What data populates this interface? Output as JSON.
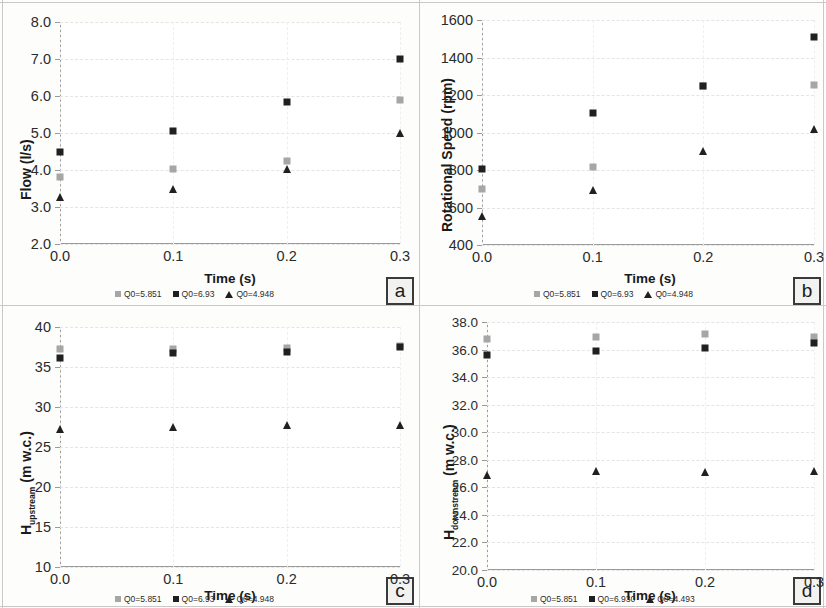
{
  "figure": {
    "background": "#fdfdfc",
    "series_colors": {
      "q0_gray": "#a6a6a6",
      "q0_black": "#202020",
      "q0_triangle": "#202020"
    }
  },
  "panels": [
    {
      "id": "a",
      "badge": "a",
      "xlabel": "Time (s)",
      "ylabel_main": "Flow (l/s)",
      "ylabel_sub": "",
      "xticks": [
        "0.0",
        "0.1",
        "0.2",
        "0.3"
      ],
      "yticks": [
        "8.0",
        "7.0",
        "6.0",
        "5.0",
        "4.0",
        "3.0",
        "2.0"
      ],
      "legend": [
        "Q0=5.851",
        "Q0=6.93",
        "Q0=4.948"
      ]
    },
    {
      "id": "b",
      "badge": "b",
      "xlabel": "Time (s)",
      "ylabel_main": "Rotational Speed (rpm)",
      "ylabel_sub": "",
      "xticks": [
        "0.0",
        "0.1",
        "0.2",
        "0.3"
      ],
      "yticks": [
        "1600",
        "1400",
        "1200",
        "1000",
        "800",
        "600",
        "400"
      ],
      "legend": [
        "Q0=5.851",
        "Q0=6.93",
        "Q0=4.948"
      ]
    },
    {
      "id": "c",
      "badge": "c",
      "xlabel": "Time (s)",
      "ylabel_main": "H",
      "ylabel_sub": "upstream",
      "ylabel_tail": "  (m w.c.)",
      "xticks": [
        "0.0",
        "0.1",
        "0.2",
        "0.3"
      ],
      "yticks": [
        "40",
        "35",
        "30",
        "25",
        "20",
        "15",
        "10"
      ],
      "legend": [
        "Q0=5.851",
        "Q0=6.93",
        "Q0=4.948"
      ]
    },
    {
      "id": "d",
      "badge": "d",
      "xlabel": "Time (s)",
      "ylabel_main": "H",
      "ylabel_sub": "downstream",
      "ylabel_tail": "  (m w.c.)",
      "xticks": [
        "0.0",
        "0.1",
        "0.2",
        "0.3"
      ],
      "yticks": [
        "38.0",
        "36.0",
        "34.0",
        "32.0",
        "30.0",
        "28.0",
        "26.0",
        "24.0",
        "22.0",
        "20.0"
      ],
      "legend": [
        "Q0=5.851",
        "Q0=6.930",
        "Q0=4.493"
      ]
    }
  ],
  "chart_data": [
    {
      "panel": "a",
      "type": "scatter",
      "title": "",
      "xlabel": "Time (s)",
      "ylabel": "Flow (l/s)",
      "x": [
        0.0,
        0.1,
        0.2,
        0.3
      ],
      "xlim": [
        0.0,
        0.3
      ],
      "ylim": [
        2.0,
        8.0
      ],
      "yticks": [
        2.0,
        3.0,
        4.0,
        5.0,
        6.0,
        7.0,
        8.0
      ],
      "grid": true,
      "legend_position": "below-axis",
      "series": [
        {
          "name": "Q0=5.851",
          "marker": "square",
          "color": "#a6a6a6",
          "values": [
            3.82,
            4.03,
            4.25,
            5.9
          ]
        },
        {
          "name": "Q0=6.93",
          "marker": "square",
          "color": "#202020",
          "values": [
            4.5,
            5.05,
            5.85,
            7.0
          ]
        },
        {
          "name": "Q0=4.948",
          "marker": "triangle",
          "color": "#202020",
          "values": [
            3.28,
            3.5,
            4.03,
            5.0
          ]
        }
      ]
    },
    {
      "panel": "b",
      "type": "scatter",
      "title": "",
      "xlabel": "Time (s)",
      "ylabel": "Rotational Speed (rpm)",
      "x": [
        0.0,
        0.1,
        0.2,
        0.3
      ],
      "xlim": [
        0.0,
        0.3
      ],
      "ylim": [
        400,
        1600
      ],
      "yticks": [
        400,
        600,
        800,
        1000,
        1200,
        1400,
        1600
      ],
      "grid": true,
      "legend_position": "below-axis",
      "series": [
        {
          "name": "Q0=5.851",
          "marker": "square",
          "color": "#a6a6a6",
          "values": [
            700,
            815,
            1250,
            1255
          ]
        },
        {
          "name": "Q0=6.93",
          "marker": "square",
          "color": "#202020",
          "values": [
            805,
            1105,
            1250,
            1510
          ]
        },
        {
          "name": "Q0=4.948",
          "marker": "triangle",
          "color": "#202020",
          "values": [
            555,
            695,
            900,
            1020
          ]
        }
      ]
    },
    {
      "panel": "c",
      "type": "scatter",
      "title": "",
      "xlabel": "Time (s)",
      "ylabel": "H upstream (m w.c.)",
      "x": [
        0.0,
        0.1,
        0.2,
        0.3
      ],
      "xlim": [
        0.0,
        0.3
      ],
      "ylim": [
        10,
        40
      ],
      "yticks": [
        10,
        15,
        20,
        25,
        30,
        35,
        40
      ],
      "grid": true,
      "legend_position": "below-axis",
      "series": [
        {
          "name": "Q0=5.851",
          "marker": "square",
          "color": "#a6a6a6",
          "values": [
            37.2,
            37.2,
            37.4,
            37.6
          ]
        },
        {
          "name": "Q0=6.93",
          "marker": "square",
          "color": "#202020",
          "values": [
            36.1,
            36.7,
            36.9,
            37.5
          ]
        },
        {
          "name": "Q0=4.948",
          "marker": "triangle",
          "color": "#202020",
          "values": [
            27.2,
            27.5,
            27.7,
            27.8
          ]
        }
      ]
    },
    {
      "panel": "d",
      "type": "scatter",
      "title": "",
      "xlabel": "Time (s)",
      "ylabel": "H downstream (m w.c.)",
      "x": [
        0.0,
        0.1,
        0.2,
        0.3
      ],
      "xlim": [
        0.0,
        0.3
      ],
      "ylim": [
        20.0,
        38.0
      ],
      "yticks": [
        20.0,
        22.0,
        24.0,
        26.0,
        28.0,
        30.0,
        32.0,
        34.0,
        36.0,
        38.0
      ],
      "grid": true,
      "legend_position": "below-axis",
      "series": [
        {
          "name": "Q0=5.851",
          "marker": "square",
          "color": "#a6a6a6",
          "values": [
            36.8,
            36.9,
            37.1,
            36.9
          ]
        },
        {
          "name": "Q0=6.930",
          "marker": "square",
          "color": "#202020",
          "values": [
            35.6,
            35.9,
            36.1,
            36.5
          ]
        },
        {
          "name": "Q0=4.493",
          "marker": "triangle",
          "color": "#202020",
          "values": [
            26.9,
            27.2,
            27.1,
            27.2
          ]
        }
      ]
    }
  ]
}
